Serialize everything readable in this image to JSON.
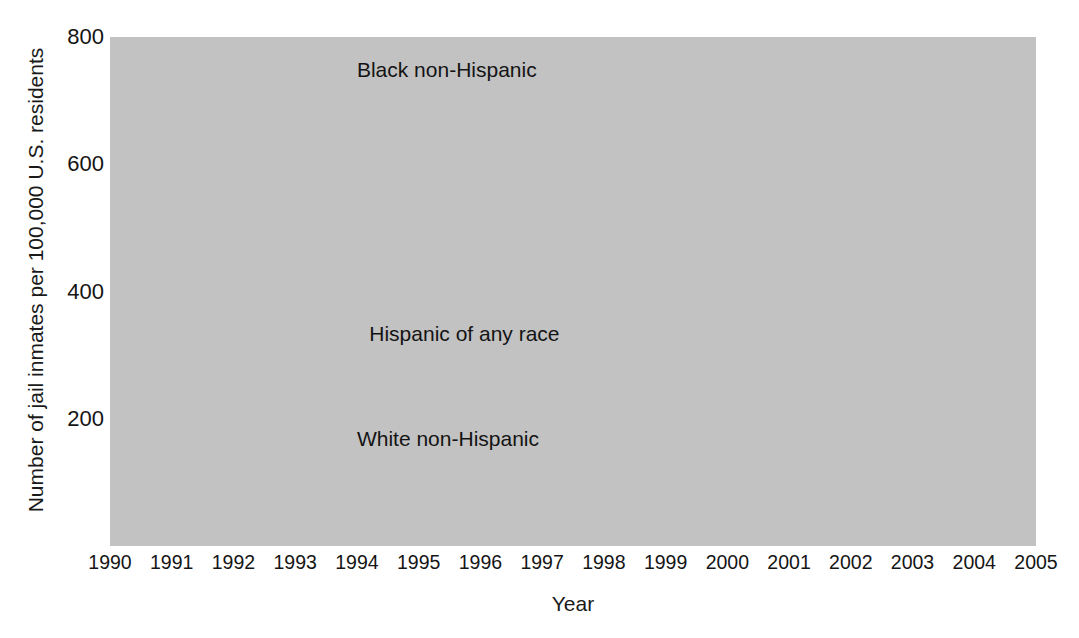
{
  "chart_data": {
    "type": "line",
    "title": "",
    "xlabel": "Year",
    "ylabel": "Number of jail inmates per 100,000 U.S. residents",
    "categories": [
      1990,
      1991,
      1992,
      1993,
      1994,
      1995,
      1996,
      1997,
      1998,
      1999,
      2000,
      2001,
      2002,
      2003,
      2004,
      2005
    ],
    "x": [
      "1990",
      "1991",
      "1992",
      "1993",
      "1994",
      "1995",
      "1996",
      "1997",
      "1998",
      "1999",
      "2000",
      "2001",
      "2002",
      "2003",
      "2004",
      "2005"
    ],
    "xlim": [
      1990,
      2005
    ],
    "ylim": [
      0,
      800
    ],
    "yticks": [
      200,
      400,
      600,
      800
    ],
    "ytick_labels": [
      "200",
      "400",
      "600",
      "800"
    ],
    "grid": true,
    "grid_color": "#ffffff",
    "plot_background": "#c2c2c2",
    "legend": "inline-labels",
    "series": [
      {
        "name": "Black non-Hispanic",
        "color": "#2e2e2e",
        "label_x": 1994.0,
        "label_y": 745,
        "values": [
          561,
          597,
          620,
          636,
          652,
          668,
          638,
          705,
          716,
          728,
          732,
          702,
          742,
          746,
          766,
          797
        ]
      },
      {
        "name": "Hispanic of any race",
        "color": "#545454",
        "label_x": 1994.2,
        "label_y": 330,
        "values": [
          241,
          243,
          249,
          259,
          274,
          270,
          260,
          290,
          289,
          286,
          281,
          270,
          254,
          266,
          262,
          266
        ]
      },
      {
        "name": "White non-Hispanic",
        "color": "#1e1e1e",
        "label_x": 1994.0,
        "label_y": 165,
        "values": [
          83,
          85,
          87,
          90,
          92,
          95,
          98,
          105,
          109,
          113,
          117,
          121,
          130,
          143,
          153,
          162
        ]
      }
    ]
  },
  "axis": {
    "y_title": "Number of jail inmates per 100,000 U.S. residents",
    "x_title": "Year"
  }
}
